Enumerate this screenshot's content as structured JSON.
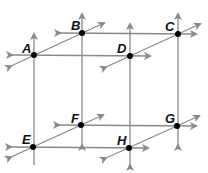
{
  "diagram": {
    "type": "lines-in-space",
    "line_color": "#8a8a8a",
    "point_color": "#000000",
    "points": [
      {
        "label": "A",
        "x": 34,
        "y": 55
      },
      {
        "label": "B",
        "x": 82,
        "y": 33
      },
      {
        "label": "C",
        "x": 178,
        "y": 34
      },
      {
        "label": "D",
        "x": 130,
        "y": 56
      },
      {
        "label": "E",
        "x": 33,
        "y": 147
      },
      {
        "label": "F",
        "x": 81,
        "y": 125
      },
      {
        "label": "G",
        "x": 177,
        "y": 126
      },
      {
        "label": "H",
        "x": 129,
        "y": 148
      }
    ],
    "labels": {
      "A": "A",
      "B": "B",
      "C": "C",
      "D": "D",
      "E": "E",
      "F": "F",
      "G": "G",
      "H": "H"
    }
  }
}
